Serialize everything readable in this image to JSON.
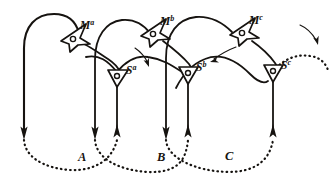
{
  "figure": {
    "ink_color": "#161310",
    "background_color": "#ffffff",
    "width": 330,
    "height": 185
  },
  "nodes": [
    {
      "id": "Ma",
      "label": "M",
      "superscript": "a",
      "kind": "motor-ganglion",
      "x": 72,
      "y": 38,
      "label_x": 80,
      "label_y": 29
    },
    {
      "id": "Mb",
      "label": "M",
      "superscript": "b",
      "kind": "motor-ganglion",
      "x": 152,
      "y": 33,
      "label_x": 160,
      "label_y": 25
    },
    {
      "id": "Mc",
      "label": "M",
      "superscript": "c",
      "kind": "motor-ganglion",
      "x": 241,
      "y": 32,
      "label_x": 249,
      "label_y": 24
    },
    {
      "id": "Sa",
      "label": "S",
      "superscript": "a",
      "kind": "sensory-ganglion",
      "x": 117,
      "y": 78,
      "label_x": 126,
      "label_y": 74
    },
    {
      "id": "Sb",
      "label": "S",
      "superscript": "b",
      "kind": "sensory-ganglion",
      "x": 187,
      "y": 75,
      "label_x": 196,
      "label_y": 71
    },
    {
      "id": "Sc",
      "label": "S",
      "superscript": "c",
      "kind": "sensory-ganglion",
      "x": 272,
      "y": 73,
      "label_x": 281,
      "label_y": 69
    }
  ],
  "segments": [
    {
      "id": "A",
      "label": "A",
      "label_x": 78,
      "label_y": 161
    },
    {
      "id": "B",
      "label": "B",
      "label_x": 157,
      "label_y": 161
    },
    {
      "id": "C",
      "label": "C",
      "label_x": 225,
      "label_y": 160
    }
  ],
  "direction_arrows": [
    {
      "id": "arrow-1",
      "note": "descending, right of Sa"
    },
    {
      "id": "arrow-2",
      "note": "descending-left, above Sb"
    },
    {
      "id": "arrow-3",
      "note": "trailing, far right"
    }
  ]
}
